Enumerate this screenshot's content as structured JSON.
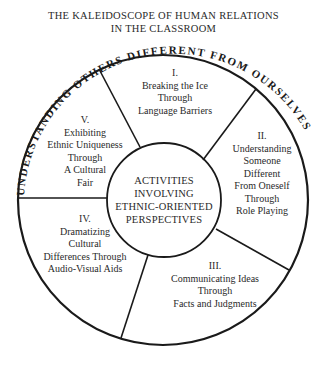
{
  "title": {
    "line1": "THE KALEIDOSCOPE OF HUMAN RELATIONS",
    "line2": "IN THE CLASSROOM"
  },
  "arc_label": "UNDERSTANDING OTHERS DIFFERENT FROM OURSELVES",
  "center": {
    "line1": "ACTIVITIES",
    "line2": "INVOLVING",
    "line3": "ETHNIC-ORIENTED",
    "line4": "PERSPECTIVES"
  },
  "segments": [
    {
      "numeral": "I.",
      "lines": [
        "Breaking the Ice",
        "Through",
        "Language Barriers"
      ]
    },
    {
      "numeral": "II.",
      "lines": [
        "Understanding",
        "Someone",
        "Different",
        "From Oneself",
        "Through",
        "Role Playing"
      ]
    },
    {
      "numeral": "III.",
      "lines": [
        "Communicating Ideas",
        "Through",
        "Facts and Judgments"
      ]
    },
    {
      "numeral": "IV.",
      "lines": [
        "Dramatizing",
        "Cultural",
        "Differences Through",
        "Audio-Visual Aids"
      ]
    },
    {
      "numeral": "V.",
      "lines": [
        "Exhibiting",
        "Ethnic Uniqueness",
        "Through",
        "A Cultural",
        "Fair"
      ]
    }
  ],
  "colors": {
    "ink": "#1a1a1a",
    "background": "#ffffff"
  }
}
